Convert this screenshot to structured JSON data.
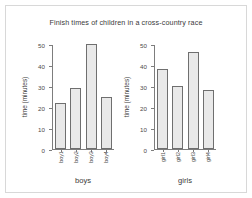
{
  "chart_data": {
    "type": "bar",
    "title": "Finish times of children in a cross-country race",
    "panels": [
      {
        "xlabel": "boys",
        "ylabel": "time (minutes)",
        "categories": [
          "boy1",
          "boy2",
          "boy3",
          "boy4"
        ],
        "values": [
          22,
          29,
          50,
          25
        ],
        "ylim": [
          0,
          50
        ],
        "yticks": [
          50,
          40,
          30,
          20,
          10,
          0
        ],
        "grid": false
      },
      {
        "xlabel": "girls",
        "ylabel": "time (minutes)",
        "categories": [
          "girl1",
          "girl2",
          "girl3",
          "girl4"
        ],
        "values": [
          38,
          30,
          46,
          28
        ],
        "ylim": [
          0,
          50
        ],
        "yticks": [
          50,
          40,
          30,
          20,
          10,
          0
        ],
        "grid": false
      }
    ],
    "legend": null,
    "colors": {
      "bar_fill": "#e9e9e9",
      "bar_edge": "#6f6f6f",
      "axis": "#7d7d7d",
      "text": "#3a3a3a",
      "frame": "#d8d8d8",
      "background": "#ffffff"
    }
  }
}
